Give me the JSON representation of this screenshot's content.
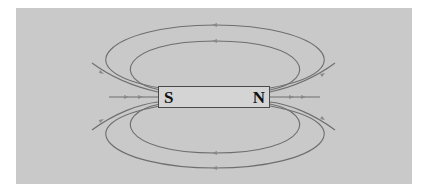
{
  "diagram": {
    "type": "bar-magnet-field-lines",
    "magnet": {
      "south_label": "S",
      "north_label": "N"
    },
    "colors": {
      "background": "#c9c9c9",
      "field_line": "#6e6e6e",
      "magnet_fill": "#d4d4d4",
      "magnet_border": "#4a4a4a",
      "label": "#111111"
    },
    "field_lines": {
      "closed_loops_top": 2,
      "closed_loops_bottom": 2,
      "open_lines_left": 3,
      "open_lines_right": 3
    }
  }
}
